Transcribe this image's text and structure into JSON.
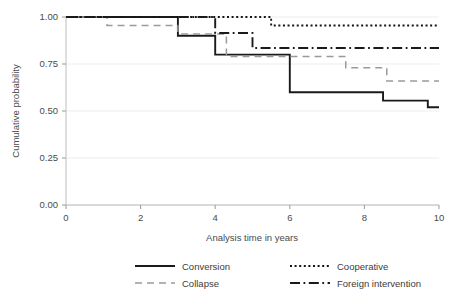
{
  "chart_data": {
    "type": "line",
    "subtype": "step-kaplan-meier",
    "title": "",
    "xlabel": "Analysis time in years",
    "ylabel": "Cumulative probability",
    "xlim": [
      0,
      10
    ],
    "ylim": [
      0,
      1
    ],
    "xticks": [
      0,
      2,
      4,
      6,
      8,
      10
    ],
    "xtick_labels": [
      "0",
      "2",
      "4",
      "6",
      "8",
      "10"
    ],
    "yticks": [
      0.0,
      0.25,
      0.5,
      0.75,
      1.0
    ],
    "ytick_labels": [
      "0.00",
      "0.25",
      "0.50",
      "0.75",
      "1.00"
    ],
    "grid": "horizontal",
    "legend_position": "bottom",
    "series": [
      {
        "name": "Conversion",
        "style": "solid",
        "color": "#1a1a1a",
        "width": 1.9,
        "dash": "none",
        "legend_order": 1,
        "x": [
          0,
          3,
          3,
          4,
          4,
          6,
          6,
          8.5,
          8.5,
          9.7,
          9.7,
          10
        ],
        "y": [
          1.0,
          1.0,
          0.9,
          0.9,
          0.8,
          0.8,
          0.6,
          0.6,
          0.555,
          0.555,
          0.52,
          0.52
        ],
        "steps": [
          {
            "time": 0.0,
            "value": 1.0
          },
          {
            "time": 3.0,
            "value": 0.9
          },
          {
            "time": 4.0,
            "value": 0.8
          },
          {
            "time": 6.0,
            "value": 0.6
          },
          {
            "time": 8.5,
            "value": 0.555
          },
          {
            "time": 9.7,
            "value": 0.52
          }
        ]
      },
      {
        "name": "Collapse",
        "style": "dashed",
        "color": "#9a9a9a",
        "width": 1.5,
        "dash": "7,5",
        "legend_order": 3,
        "x": [
          0,
          1.1,
          1.1,
          3,
          3,
          4.3,
          4.3,
          7.5,
          7.5,
          8.6,
          8.6,
          10
        ],
        "y": [
          1.0,
          1.0,
          0.955,
          0.955,
          0.91,
          0.91,
          0.79,
          0.79,
          0.73,
          0.73,
          0.66,
          0.66
        ],
        "steps": [
          {
            "time": 0.0,
            "value": 1.0
          },
          {
            "time": 1.1,
            "value": 0.955
          },
          {
            "time": 3.0,
            "value": 0.91
          },
          {
            "time": 4.3,
            "value": 0.79
          },
          {
            "time": 7.5,
            "value": 0.73
          },
          {
            "time": 8.6,
            "value": 0.66
          }
        ]
      },
      {
        "name": "Cooperative",
        "style": "dotted",
        "color": "#141414",
        "width": 1.9,
        "dash": "2,2.6",
        "legend_order": 2,
        "x": [
          0,
          5.5,
          5.5,
          10
        ],
        "y": [
          1.0,
          1.0,
          0.955,
          0.955
        ],
        "steps": [
          {
            "time": 0.0,
            "value": 1.0
          },
          {
            "time": 5.5,
            "value": 0.955
          }
        ]
      },
      {
        "name": "Foreign intervention",
        "style": "dash-dot",
        "color": "#1a1a1a",
        "width": 1.9,
        "dash": "10,3.5,1.8,3.5",
        "legend_order": 4,
        "x": [
          0,
          4.0,
          4.0,
          5.0,
          5.0,
          10
        ],
        "y": [
          1.0,
          1.0,
          0.915,
          0.915,
          0.835,
          0.835
        ],
        "steps": [
          {
            "time": 0.0,
            "value": 1.0
          },
          {
            "time": 4.0,
            "value": 0.915
          },
          {
            "time": 5.0,
            "value": 0.835
          }
        ]
      }
    ]
  },
  "legend": {
    "items": [
      {
        "label": "Conversion"
      },
      {
        "label": "Cooperative"
      },
      {
        "label": "Collapse"
      },
      {
        "label": "Foreign intervention"
      }
    ]
  },
  "axes": {
    "xlabel": "Analysis time in years",
    "ylabel": "Cumulative probability"
  }
}
